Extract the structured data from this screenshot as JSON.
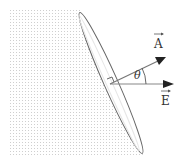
{
  "diagram": {
    "labels": {
      "area_vector": "A",
      "field_vector": "E",
      "angle": "θ"
    },
    "colors": {
      "stroke": "#555555",
      "dots": "#c8c8c8",
      "text": "#333333"
    }
  }
}
